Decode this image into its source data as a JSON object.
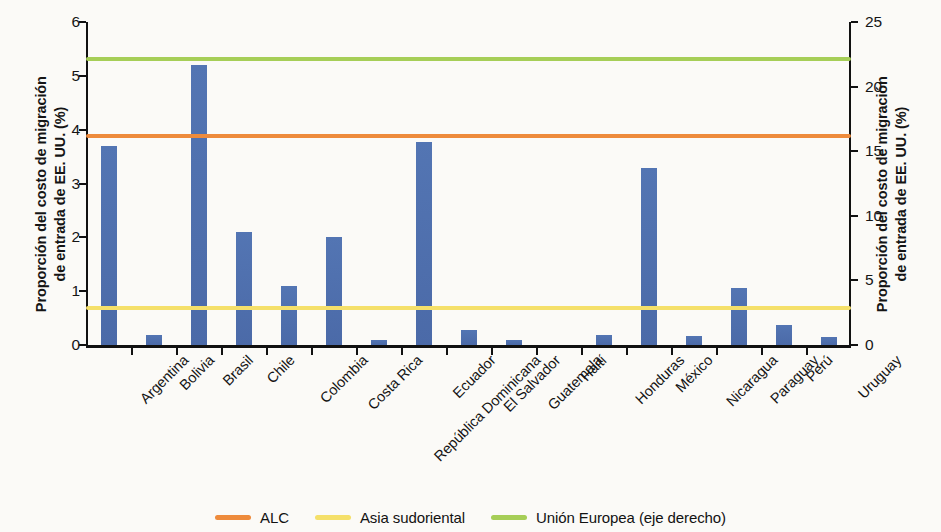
{
  "axes": {
    "left_title_line1": "Proporción del costo de migración",
    "left_title_line2": "de entrada de EE. UU. (%)",
    "right_title_line1": "Proporción del costo de migración",
    "right_title_line2": "de entrada de EE. UU. (%)",
    "left_ticks": [
      "0",
      "1",
      "2",
      "3",
      "4",
      "5",
      "6"
    ],
    "right_ticks": [
      "0",
      "5",
      "10",
      "15",
      "20",
      "25"
    ]
  },
  "legend": {
    "items": [
      {
        "label": "ALC",
        "color": "#ee8b3c"
      },
      {
        "label": "Asia sudoriental",
        "color": "#f5e06a"
      },
      {
        "label": "Unión Europea (eje derecho)",
        "color": "#a6ce57"
      }
    ]
  },
  "chart_data": {
    "type": "bar",
    "title": "",
    "xlabel": "",
    "ylabel": "Proporción del costo de migración de entrada de EE. UU. (%)",
    "ylabel_right": "Proporción del costo de migración de entrada de EE. UU. (%)",
    "ylim": [
      0,
      6
    ],
    "ylim_right": [
      0,
      25
    ],
    "grid": false,
    "legend_position": "bottom",
    "bar_color": "#4f6fad",
    "categories": [
      "Argentina",
      "Bolivia",
      "Brasil",
      "Chile",
      "Colombia",
      "Costa Rica",
      "República Dominicana",
      "Ecuador",
      "El Salvador",
      "Guatemala",
      "Haití",
      "Honduras",
      "México",
      "Nicaragua",
      "Paraguay",
      "Perú",
      "Uruguay"
    ],
    "values": [
      3.7,
      0.18,
      5.2,
      2.1,
      1.1,
      2.0,
      0.1,
      3.78,
      0.28,
      0.09,
      0.0,
      0.18,
      3.28,
      0.17,
      1.05,
      0.37,
      0.15
    ],
    "reference_lines": [
      {
        "name": "ALC",
        "value": 3.88,
        "axis": "left",
        "color": "#ee8b3c"
      },
      {
        "name": "Asia sudoriental",
        "value": 0.68,
        "axis": "left",
        "color": "#f5e06a"
      },
      {
        "name": "Unión Europea (eje derecho)",
        "value": 22.2,
        "value_left_scale": 5.32,
        "axis": "right",
        "color": "#a6ce57"
      }
    ]
  }
}
